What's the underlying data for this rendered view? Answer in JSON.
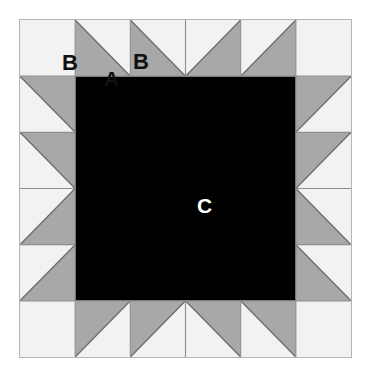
{
  "diagram": {
    "type": "quilt-block",
    "grid": {
      "columns": 6,
      "rows": 6
    },
    "labels": {
      "b_corner": "B",
      "a_triangle": "A",
      "b_triangle": "B",
      "c_center": "C"
    },
    "colors": {
      "background": "#ffffff",
      "light_fabric": "#f2f2f2",
      "medium_fabric": "#a8a8a8",
      "dark_fabric": "#000000",
      "seam_line": "#6e6e6e",
      "outer_border": "#b5b5b5",
      "label_dark": "#111111",
      "label_light": "#ffffff"
    },
    "pieces": [
      {
        "code": "A",
        "fabric": "medium_fabric",
        "shape": "half-square-triangle",
        "description": "medium gray triangle"
      },
      {
        "code": "B",
        "fabric": "light_fabric",
        "shape": "square-and-half-square-triangle",
        "description": "light background square and triangle"
      },
      {
        "code": "C",
        "fabric": "dark_fabric",
        "shape": "square",
        "description": "large dark center square"
      }
    ]
  }
}
